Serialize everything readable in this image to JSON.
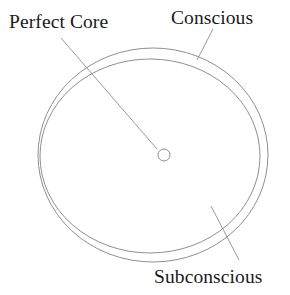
{
  "diagram": {
    "type": "concentric-circle-diagram",
    "background_color": "#ffffff",
    "stroke_color": "#8a8a8a",
    "text_color": "#1a1a1a",
    "labels": {
      "perfect_core": "Perfect Core",
      "conscious": "Conscious",
      "subconscious": "Subconscious"
    },
    "shapes": {
      "outer_circle": {
        "name": "conscious-ring",
        "cx": 153,
        "cy": 155,
        "rx": 115,
        "ry": 107
      },
      "inner_circle": {
        "name": "subconscious-ring",
        "cx": 150,
        "cy": 155,
        "rx": 110,
        "ry": 97
      },
      "center_circle": {
        "name": "perfect-core-dot",
        "cx": 164,
        "cy": 155,
        "r": 6
      }
    },
    "leaders": {
      "perfect_core": {
        "x1": 61,
        "y1": 38,
        "x2": 157,
        "y2": 149
      },
      "conscious": {
        "x1": 213,
        "y1": 29,
        "x2": 197,
        "y2": 60
      },
      "subconscious": {
        "x1": 211,
        "y1": 206,
        "x2": 239,
        "y2": 260
      }
    }
  }
}
